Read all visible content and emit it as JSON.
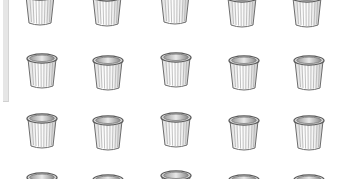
{
  "view": {
    "type": "icon-grid",
    "item_icon": "wastebasket-icon",
    "colors": {
      "background": "#ffffff",
      "panel_edge": "#e6e6e6",
      "rim_dark": "#5a5a5a",
      "rim_light": "#d8d8d8",
      "body_fill": "#f4f4f4",
      "rib": "#b0b0b0",
      "outline": "#6e6e6e"
    }
  },
  "grid": {
    "columns": 5,
    "rows": 4,
    "items": [
      {
        "row": 0,
        "col": 0,
        "x": 22,
        "y": -12,
        "icon": "wastebasket-icon"
      },
      {
        "row": 0,
        "col": 1,
        "x": 89,
        "y": -11,
        "icon": "wastebasket-icon"
      },
      {
        "row": 0,
        "col": 2,
        "x": 157,
        "y": -13,
        "icon": "wastebasket-icon"
      },
      {
        "row": 0,
        "col": 3,
        "x": 224,
        "y": -10,
        "icon": "wastebasket-icon"
      },
      {
        "row": 0,
        "col": 4,
        "x": 289,
        "y": -10,
        "icon": "wastebasket-icon"
      },
      {
        "row": 1,
        "col": 0,
        "x": 24,
        "y": 51,
        "icon": "wastebasket-icon"
      },
      {
        "row": 1,
        "col": 1,
        "x": 90,
        "y": 53,
        "icon": "wastebasket-icon"
      },
      {
        "row": 1,
        "col": 2,
        "x": 158,
        "y": 50,
        "icon": "wastebasket-icon"
      },
      {
        "row": 1,
        "col": 3,
        "x": 226,
        "y": 53,
        "icon": "wastebasket-icon"
      },
      {
        "row": 1,
        "col": 4,
        "x": 291,
        "y": 53,
        "icon": "wastebasket-icon"
      },
      {
        "row": 2,
        "col": 0,
        "x": 24,
        "y": 111,
        "icon": "wastebasket-icon"
      },
      {
        "row": 2,
        "col": 1,
        "x": 90,
        "y": 113,
        "icon": "wastebasket-icon"
      },
      {
        "row": 2,
        "col": 2,
        "x": 158,
        "y": 110,
        "icon": "wastebasket-icon"
      },
      {
        "row": 2,
        "col": 3,
        "x": 226,
        "y": 113,
        "icon": "wastebasket-icon"
      },
      {
        "row": 2,
        "col": 4,
        "x": 291,
        "y": 113,
        "icon": "wastebasket-icon"
      },
      {
        "row": 3,
        "col": 0,
        "x": 24,
        "y": 170,
        "icon": "wastebasket-icon"
      },
      {
        "row": 3,
        "col": 1,
        "x": 90,
        "y": 172,
        "icon": "wastebasket-icon"
      },
      {
        "row": 3,
        "col": 2,
        "x": 158,
        "y": 168,
        "icon": "wastebasket-icon"
      },
      {
        "row": 3,
        "col": 3,
        "x": 226,
        "y": 172,
        "icon": "wastebasket-icon"
      },
      {
        "row": 3,
        "col": 4,
        "x": 291,
        "y": 172,
        "icon": "wastebasket-icon"
      }
    ]
  }
}
